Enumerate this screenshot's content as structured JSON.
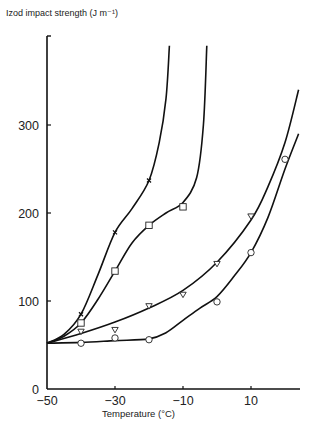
{
  "chart_data": {
    "type": "line",
    "title": "",
    "xlabel": "Temperature (°C)",
    "ylabel": "Izod impact strength (J m⁻¹)",
    "xlim": [
      -50,
      25
    ],
    "ylim": [
      0,
      390
    ],
    "xticks": [
      -50,
      -30,
      -10,
      10
    ],
    "yticks": [
      0,
      100,
      200,
      300
    ],
    "grid": false,
    "legend": "none",
    "series": [
      {
        "name": "×",
        "marker": "x",
        "x": [
          -40,
          -30,
          -20
        ],
        "values": [
          85,
          178,
          237
        ],
        "curve": [
          [
            -50,
            52
          ],
          [
            -45,
            62
          ],
          [
            -40,
            85
          ],
          [
            -35,
            130
          ],
          [
            -30,
            178
          ],
          [
            -25,
            205
          ],
          [
            -20,
            237
          ],
          [
            -17,
            280
          ],
          [
            -15,
            330
          ],
          [
            -14,
            390
          ]
        ]
      },
      {
        "name": "□",
        "marker": "square",
        "x": [
          -40,
          -30,
          -20,
          -10
        ],
        "values": [
          75,
          134,
          186,
          207
        ],
        "curve": [
          [
            -50,
            52
          ],
          [
            -45,
            60
          ],
          [
            -40,
            75
          ],
          [
            -35,
            102
          ],
          [
            -30,
            134
          ],
          [
            -25,
            166
          ],
          [
            -20,
            186
          ],
          [
            -15,
            200
          ],
          [
            -10,
            212
          ],
          [
            -6,
            240
          ],
          [
            -4,
            300
          ],
          [
            -3,
            390
          ]
        ]
      },
      {
        "name": "▽",
        "marker": "triangle-down",
        "x": [
          -40,
          -30,
          -20,
          -10,
          0,
          10
        ],
        "values": [
          65,
          67,
          94,
          107,
          142,
          196
        ],
        "curve": [
          [
            -50,
            52
          ],
          [
            -40,
            63
          ],
          [
            -30,
            76
          ],
          [
            -20,
            92
          ],
          [
            -10,
            112
          ],
          [
            0,
            144
          ],
          [
            10,
            192
          ],
          [
            15,
            230
          ],
          [
            20,
            280
          ],
          [
            24,
            340
          ]
        ]
      },
      {
        "name": "○",
        "marker": "circle",
        "x": [
          -40,
          -30,
          -20,
          0,
          10,
          20
        ],
        "values": [
          52,
          58,
          56,
          99,
          155,
          261
        ],
        "curve": [
          [
            -50,
            52
          ],
          [
            -40,
            53
          ],
          [
            -30,
            55
          ],
          [
            -20,
            57
          ],
          [
            -15,
            64
          ],
          [
            -10,
            78
          ],
          [
            -5,
            92
          ],
          [
            0,
            105
          ],
          [
            5,
            128
          ],
          [
            10,
            155
          ],
          [
            15,
            195
          ],
          [
            20,
            250
          ],
          [
            24,
            290
          ]
        ]
      }
    ]
  }
}
